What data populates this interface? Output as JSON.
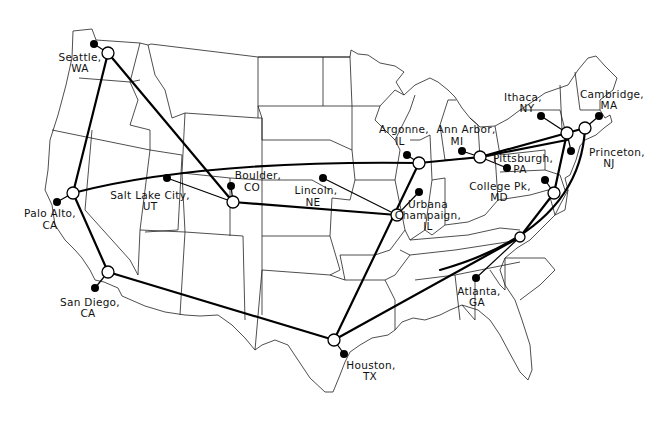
{
  "map": {
    "title": "Network sites across the United States",
    "colors": {
      "background": "#ffffff",
      "link": "#000000",
      "border": "#222222",
      "host": "#000000",
      "router_fill": "#ffffff"
    },
    "sites": [
      {
        "id": "seattle",
        "line1": "Seattle,",
        "line2": "WA"
      },
      {
        "id": "paloalto",
        "line1": "Palo Alto,",
        "line2": "CA"
      },
      {
        "id": "sandiego",
        "line1": "San Diego,",
        "line2": "CA"
      },
      {
        "id": "saltlake",
        "line1": "Salt Lake City,",
        "line2": "UT"
      },
      {
        "id": "boulder",
        "line1": "Boulder,",
        "line2": "CO"
      },
      {
        "id": "lincoln",
        "line1": "Lincoln,",
        "line2": "NE"
      },
      {
        "id": "houston",
        "line1": "Houston,",
        "line2": "TX"
      },
      {
        "id": "argonne",
        "line1": "Argonne,",
        "line2": "IL"
      },
      {
        "id": "urbana",
        "line1": "Urbana",
        "line2": "Champaign,",
        "line3": "IL"
      },
      {
        "id": "annarbor",
        "line1": "Ann Arbor,",
        "line2": "MI"
      },
      {
        "id": "pittsburgh",
        "line1": "Pittsburgh,",
        "line2": "PA"
      },
      {
        "id": "ithaca",
        "line1": "Ithaca,",
        "line2": "NY"
      },
      {
        "id": "cambridge",
        "line1": "Cambridge,",
        "line2": "MA"
      },
      {
        "id": "princeton",
        "line1": "Princeton,",
        "line2": "NJ"
      },
      {
        "id": "collegepk",
        "line1": "College Pk,",
        "line2": "MD"
      },
      {
        "id": "atlanta",
        "line1": "Atlanta,",
        "line2": "GA"
      }
    ],
    "legend": {
      "router_icon": "open-circle",
      "host_icon": "filled-dot"
    }
  }
}
